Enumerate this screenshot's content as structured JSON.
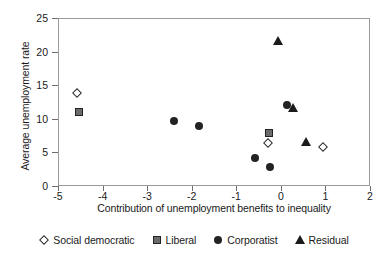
{
  "chart_data": {
    "type": "scatter",
    "title": "",
    "xlabel": "Contribution of unemployment benefits to inequality",
    "ylabel": "Average unemployment rate",
    "xlim": [
      -5,
      2
    ],
    "ylim": [
      0,
      25
    ],
    "xticks": [
      -5,
      -4,
      -3,
      -2,
      -1,
      0,
      1,
      2
    ],
    "xtick_labels": [
      "-5",
      "-4",
      "-3",
      "-2",
      "-1",
      "0",
      "1",
      "2"
    ],
    "yticks": [
      0,
      5,
      10,
      15,
      20,
      25
    ],
    "ytick_labels": [
      "0",
      "5",
      "10",
      "15",
      "20",
      "25"
    ],
    "grid": false,
    "legend_position": "below",
    "series": [
      {
        "name": "Social democratic",
        "marker": "diamond-open",
        "color": "#ffffff",
        "edge_color": "#2b2b2b",
        "points": [
          {
            "x": -4.6,
            "y": 14.0
          },
          {
            "x": -0.3,
            "y": 6.6
          },
          {
            "x": 0.93,
            "y": 6.0
          }
        ]
      },
      {
        "name": "Liberal",
        "marker": "square-filled",
        "color": "#6b6b6b",
        "edge_color": "#222222",
        "points": [
          {
            "x": -4.55,
            "y": 11.2
          },
          {
            "x": -0.28,
            "y": 8.1
          }
        ]
      },
      {
        "name": "Corporatist",
        "marker": "circle-filled",
        "color": "#232323",
        "edge_color": "#232323",
        "points": [
          {
            "x": -2.42,
            "y": 9.8
          },
          {
            "x": -1.85,
            "y": 9.1
          },
          {
            "x": -0.6,
            "y": 4.3
          },
          {
            "x": -0.27,
            "y": 3.0
          },
          {
            "x": 0.12,
            "y": 12.2
          }
        ]
      },
      {
        "name": "Residual",
        "marker": "triangle-filled",
        "color": "#1b1b1b",
        "edge_color": "#1b1b1b",
        "points": [
          {
            "x": -0.09,
            "y": 21.8
          },
          {
            "x": 0.26,
            "y": 11.7
          },
          {
            "x": 0.55,
            "y": 6.7
          }
        ]
      }
    ]
  },
  "legend": {
    "entries": [
      {
        "label": "Social democratic",
        "icon": "diamond-open-icon"
      },
      {
        "label": "Liberal",
        "icon": "square-filled-icon"
      },
      {
        "label": "Corporatist",
        "icon": "circle-filled-icon"
      },
      {
        "label": "Residual",
        "icon": "triangle-filled-icon"
      }
    ]
  }
}
